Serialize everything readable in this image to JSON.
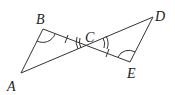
{
  "diagram": {
    "type": "geometry",
    "points": {
      "A": {
        "label": "A",
        "x": 21,
        "y": 73
      },
      "B": {
        "label": "B",
        "x": 43,
        "y": 29
      },
      "C": {
        "label": "C",
        "x": 92,
        "y": 43
      },
      "D": {
        "label": "D",
        "x": 153,
        "y": 17
      },
      "E": {
        "label": "E",
        "x": 130,
        "y": 62
      }
    },
    "segments": [
      "AB",
      "BE",
      "AD",
      "DE"
    ],
    "markings": {
      "equal_segments": [
        "BC",
        "CE"
      ],
      "equal_angles_single_arc": [
        "B",
        "E"
      ],
      "equal_angles_double_arc": [
        "ACB",
        "DCE"
      ]
    },
    "colors": {
      "stroke": "#333333",
      "label": "#222222"
    }
  }
}
